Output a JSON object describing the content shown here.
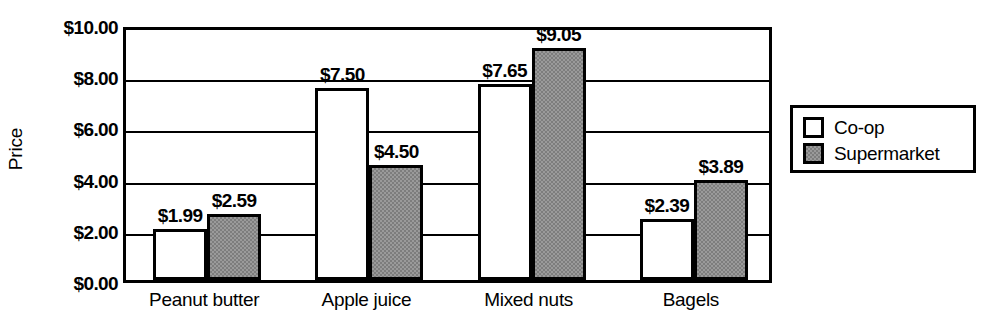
{
  "chart_data": {
    "type": "bar",
    "title": "",
    "subtitle": "",
    "xlabel": "",
    "ylabel": "Price",
    "categories": [
      "Peanut butter",
      "Apple juice",
      "Mixed nuts",
      "Bagels"
    ],
    "series": [
      {
        "name": "Co-op",
        "color": "#ffffff",
        "values": [
          1.99,
          7.5,
          7.65,
          2.39
        ],
        "value_labels": [
          "$1.99",
          "$7.50",
          "$7.65",
          "$2.39"
        ]
      },
      {
        "name": "Supermarket",
        "color": "#9a9a9a",
        "values": [
          2.59,
          4.5,
          9.05,
          3.89
        ],
        "value_labels": [
          "$2.59",
          "$4.50",
          "$9.05",
          "$3.89"
        ]
      }
    ],
    "ylim": [
      0,
      10
    ],
    "ytick_values": [
      0,
      2,
      4,
      6,
      8,
      10
    ],
    "ytick_labels": [
      "$0.00",
      "$2.00",
      "$4.00",
      "$6.00",
      "$8.00",
      "$10.00"
    ],
    "grid": true,
    "grid_axis": "y",
    "legend_position": "right",
    "legend_entries": [
      "Co-op",
      "Supermarket"
    ],
    "bar_border_color": "#000000",
    "axis_color": "#000000",
    "background_color": "#ffffff"
  }
}
